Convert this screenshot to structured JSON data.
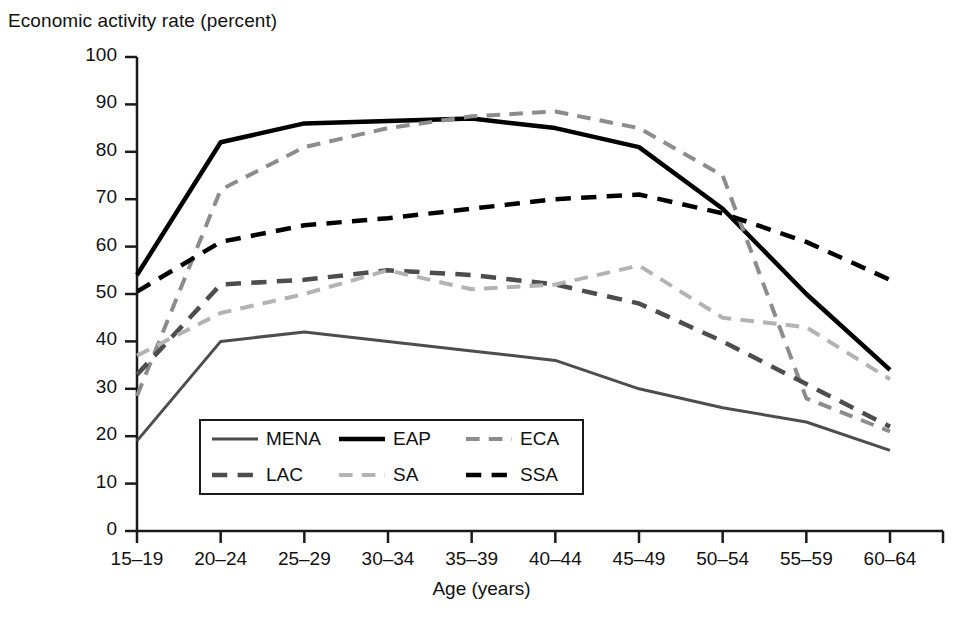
{
  "chart_data": {
    "type": "line",
    "title": "",
    "ylabel": "Economic activity rate (percent)",
    "xlabel": "Age (years)",
    "ylim": [
      0,
      100
    ],
    "ytick_step": 10,
    "grid": false,
    "legend_position": "inside-bottom-left",
    "categories": [
      "15–19",
      "20–24",
      "25–29",
      "30–34",
      "35–39",
      "40–44",
      "45–49",
      "50–54",
      "55–59",
      "60–64"
    ],
    "ytick_labels": [
      "0",
      "10",
      "20",
      "30",
      "40",
      "50",
      "60",
      "70",
      "80",
      "90",
      "100"
    ],
    "series": [
      {
        "name": "MENA",
        "label": "MENA",
        "color": "#4d4d4d",
        "style": "solid",
        "width": 3,
        "values": [
          19,
          40,
          42,
          40,
          38,
          36,
          30,
          26,
          23,
          17
        ]
      },
      {
        "name": "EAP",
        "label": "EAP",
        "color": "#000000",
        "style": "solid",
        "width": 4.5,
        "values": [
          54,
          82,
          86,
          86.5,
          87,
          85,
          81,
          68,
          50,
          34
        ]
      },
      {
        "name": "ECA",
        "label": "ECA",
        "color": "#8c8c8c",
        "style": "dashed",
        "width": 4,
        "values": [
          28.5,
          72,
          81,
          85,
          87.5,
          88.5,
          85,
          75,
          28,
          21
        ]
      },
      {
        "name": "LAC",
        "label": "LAC",
        "color": "#4d4d4d",
        "style": "dashed",
        "width": 4.5,
        "values": [
          33,
          52,
          53,
          55,
          54,
          52,
          48,
          40,
          31,
          22
        ]
      },
      {
        "name": "SA",
        "label": "SA",
        "color": "#b3b3b3",
        "style": "dashed",
        "width": 4,
        "values": [
          37,
          46,
          50,
          55,
          51,
          52,
          56,
          45,
          43,
          32
        ]
      },
      {
        "name": "SSA",
        "label": "SSA",
        "color": "#000000",
        "style": "dashed",
        "width": 4.5,
        "values": [
          50.5,
          61,
          64.5,
          66,
          68,
          70,
          71,
          67,
          61,
          53
        ]
      }
    ]
  },
  "axes": {
    "y_title": "Economic activity rate (percent)",
    "x_title": "Age (years)"
  },
  "legend": {
    "entries": [
      {
        "label": "MENA"
      },
      {
        "label": "EAP"
      },
      {
        "label": "ECA"
      },
      {
        "label": "LAC"
      },
      {
        "label": "SA"
      },
      {
        "label": "SSA"
      }
    ]
  }
}
